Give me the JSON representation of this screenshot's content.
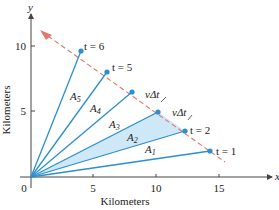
{
  "figure": {
    "x_axis_label": "Kilometers",
    "y_axis_label": "Kilometers",
    "x_axis_var": "x",
    "y_axis_var": "y",
    "origin_label": "0",
    "x_ticks": [
      "5",
      "10",
      "15"
    ],
    "y_ticks": [
      "5",
      "10"
    ],
    "points": [
      {
        "label": "t = 1",
        "x": 14.2,
        "y": 2.0
      },
      {
        "label": "t = 2",
        "x": 12.2,
        "y": 3.5
      },
      {
        "label": "t = 3",
        "x": 10.1,
        "y": 5.0
      },
      {
        "label": "t = 4",
        "x": 8.0,
        "y": 6.6
      },
      {
        "label": "t = 5",
        "x": 6.0,
        "y": 8.1
      },
      {
        "label": "t = 6",
        "x": 4.0,
        "y": 9.7
      }
    ],
    "areas": [
      "A1",
      "A2",
      "A3",
      "A4",
      "A5"
    ],
    "highlighted_area": "A2",
    "segment_labels": [
      "vΔt",
      "vΔt"
    ],
    "colors": {
      "rays": "#2b8fd0",
      "highlight_fill": "#cfe8f7",
      "path_dashed": "#e07a6a",
      "axes": "#444444"
    }
  }
}
